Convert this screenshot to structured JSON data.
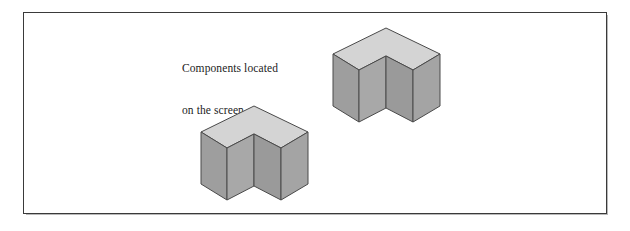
{
  "figure": {
    "background_color": "#ffffff",
    "frame": {
      "border_color": "#3a3a3a",
      "shadow_color": "#b9b9b9"
    },
    "caption": {
      "line1": "Components located",
      "line2": "on the screen",
      "color": "#1c1c1c"
    },
    "palette": {
      "top_face": "#d4d4d4",
      "left_face": "#9e9e9e",
      "right_face": "#a8a8a8",
      "inner_left_face": "#9a9a9a",
      "inner_right_face": "#a4a4a4",
      "outline": "#4a4a4a"
    },
    "shapes": [
      {
        "id": "shape-upper-right",
        "name": "isometric-l-block-upper-right",
        "label": "L-shaped corner component"
      },
      {
        "id": "shape-lower-left",
        "name": "isometric-l-block-lower-left",
        "label": "L-shaped corner component"
      }
    ]
  }
}
